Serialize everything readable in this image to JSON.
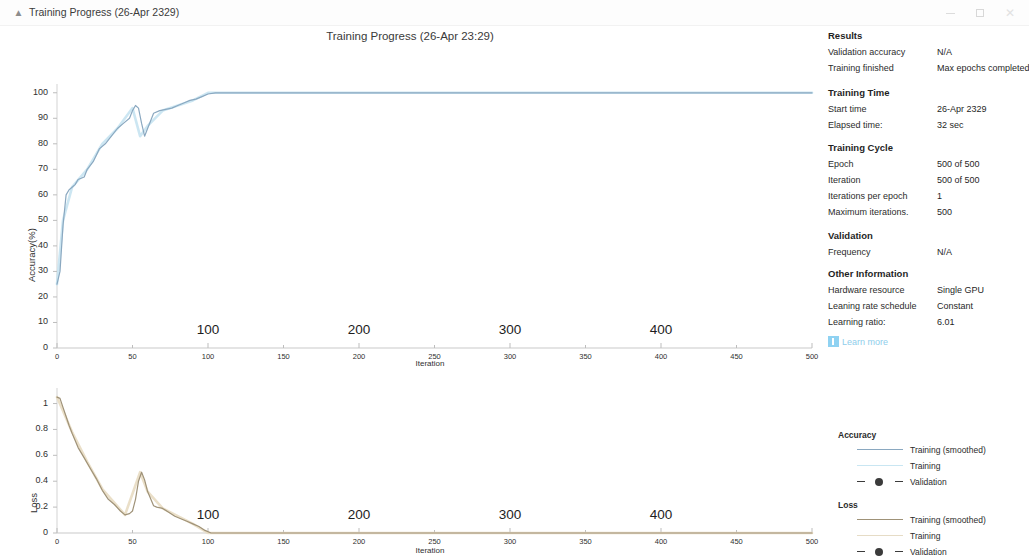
{
  "window": {
    "title": "Training Progress (26-Apr 2329)",
    "icon": "chart-icon",
    "minimize_label": "–",
    "maximize_label": "□",
    "close_label": "×"
  },
  "chart_title": "Training Progress (26-Apr 23:29)",
  "accuracy_chart": {
    "ylabel": "Accuracy(%)",
    "xlabel": "Iteration",
    "yticks": [
      "0",
      "10",
      "20",
      "30",
      "40",
      "50",
      "60",
      "70",
      "80",
      "90",
      "100"
    ],
    "xticks": [
      "0",
      "50",
      "100",
      "150",
      "200",
      "250",
      "300",
      "350",
      "400",
      "450",
      "500"
    ],
    "big_xlabels": [
      "100",
      "200",
      "300",
      "400"
    ]
  },
  "loss_chart": {
    "ylabel": "Loss",
    "xlabel": "Iteration",
    "yticks": [
      "0",
      "0.2",
      "0.4",
      "0.6",
      "0.8",
      "1"
    ],
    "xticks": [
      "0",
      "50",
      "100",
      "150",
      "200",
      "250",
      "300",
      "350",
      "400",
      "450",
      "500"
    ],
    "big_xlabels": [
      "100",
      "200",
      "300",
      "400"
    ]
  },
  "info": {
    "results": {
      "heading": "Results",
      "rows": [
        {
          "label": "Validation accuracy",
          "value": "N/A"
        },
        {
          "label": "Training finished",
          "value": "Max epochs completed"
        }
      ]
    },
    "training_time": {
      "heading": "Training Time",
      "rows": [
        {
          "label": "Start time",
          "value": "26-Apr 2329"
        },
        {
          "label": "Elapsed time:",
          "value": "32 sec"
        }
      ]
    },
    "training_cycle": {
      "heading": "Training Cycle",
      "rows": [
        {
          "label": "Epoch",
          "value": "500 of 500"
        },
        {
          "label": "Iteration",
          "value": "500 of 500"
        },
        {
          "label": "Iterations per epoch",
          "value": "1"
        },
        {
          "label": "Maximum iterations.",
          "value": "500"
        }
      ]
    },
    "validation": {
      "heading": "Validation",
      "rows": [
        {
          "label": "Frequency",
          "value": "N/A"
        }
      ]
    },
    "other_information": {
      "heading": "Other Information",
      "rows": [
        {
          "label": "Hardware resource",
          "value": "Single GPU"
        },
        {
          "label": "Leaning rate schedule",
          "value": "Constant"
        },
        {
          "label": "Learning ratio:",
          "value": "6.01"
        }
      ]
    },
    "learn_more": "Learn more"
  },
  "legend": {
    "accuracy": {
      "heading": "Accuracy",
      "items": [
        {
          "label": "Training (smoothed)",
          "color": "#8aa8c0",
          "style": "line"
        },
        {
          "label": "Training",
          "color": "#c9e6f2",
          "style": "line"
        },
        {
          "label": "Validation",
          "color": "#3b3b3b",
          "style": "dashed-marker"
        }
      ]
    },
    "loss": {
      "heading": "Loss",
      "items": [
        {
          "label": "Training (smoothed)",
          "color": "#9f9278",
          "style": "line"
        },
        {
          "label": "Training",
          "color": "#e6dcc6",
          "style": "line"
        },
        {
          "label": "Validation",
          "color": "#3b3b3b",
          "style": "dashed-marker"
        }
      ]
    }
  },
  "colors": {
    "accuracy_smoothed": "#8aa8c0",
    "accuracy_raw": "#c3e2f0",
    "loss_smoothed": "#9f9278",
    "loss_raw": "#e8dcc2",
    "axis": "#c9c9c9",
    "link": "#8ecdeb"
  },
  "chart_data": [
    {
      "type": "line",
      "title": "Training Progress (26-Apr 23:29)",
      "xlabel": "Iteration",
      "ylabel": "Accuracy(%)",
      "xlim": [
        0,
        500
      ],
      "ylim": [
        0,
        105
      ],
      "grid": false,
      "legend_position": "right",
      "series": [
        {
          "name": "Training (smoothed)",
          "color": "#8aa8c0",
          "x": [
            0,
            2,
            4,
            6,
            8,
            10,
            12,
            14,
            16,
            18,
            20,
            24,
            28,
            32,
            36,
            40,
            44,
            48,
            50,
            52,
            54,
            56,
            58,
            60,
            64,
            68,
            72,
            76,
            80,
            84,
            88,
            92,
            96,
            100,
            105,
            150,
            200,
            250,
            300,
            350,
            400,
            450,
            500
          ],
          "y": [
            25,
            30,
            48,
            60,
            62,
            63,
            64,
            66,
            66.5,
            67,
            70,
            73,
            78,
            80,
            83,
            86,
            88,
            90,
            93,
            95,
            94,
            88,
            83,
            86,
            92,
            93,
            93.5,
            94,
            95,
            96,
            97,
            97.5,
            98.5,
            99.5,
            100,
            100,
            100,
            100,
            100,
            100,
            100,
            100,
            100
          ]
        },
        {
          "name": "Training",
          "color": "#c3e2f0",
          "x": [
            0,
            4,
            10,
            20,
            30,
            40,
            50,
            55,
            60,
            70,
            80,
            90,
            100,
            200,
            300,
            400,
            500
          ],
          "y": [
            25,
            50,
            63,
            70,
            80,
            86,
            94,
            83,
            87,
            93,
            95,
            97,
            100,
            100,
            100,
            100,
            100
          ]
        }
      ]
    },
    {
      "type": "line",
      "xlabel": "Iteration",
      "ylabel": "Loss",
      "xlim": [
        0,
        500
      ],
      "ylim": [
        0,
        1.1
      ],
      "grid": false,
      "legend_position": "right",
      "series": [
        {
          "name": "Training (smoothed)",
          "color": "#9f9278",
          "x": [
            0,
            2,
            4,
            6,
            8,
            10,
            14,
            18,
            22,
            26,
            30,
            34,
            38,
            42,
            45,
            48,
            50,
            52,
            54,
            56,
            58,
            60,
            64,
            66,
            70,
            74,
            78,
            82,
            86,
            90,
            94,
            98,
            102,
            150,
            200,
            250,
            300,
            350,
            400,
            450,
            500
          ],
          "y": [
            1.05,
            1.04,
            0.97,
            0.9,
            0.83,
            0.77,
            0.66,
            0.58,
            0.5,
            0.42,
            0.33,
            0.26,
            0.22,
            0.17,
            0.14,
            0.15,
            0.17,
            0.26,
            0.4,
            0.47,
            0.41,
            0.32,
            0.21,
            0.2,
            0.19,
            0.16,
            0.13,
            0.11,
            0.09,
            0.07,
            0.05,
            0.02,
            0.0,
            0.0,
            0.0,
            0.0,
            0.0,
            0.0,
            0.0,
            0.0,
            0.0
          ]
        },
        {
          "name": "Training",
          "color": "#e8dcc2",
          "x": [
            0,
            10,
            20,
            30,
            45,
            55,
            60,
            70,
            80,
            90,
            100,
            200,
            300,
            400,
            500
          ],
          "y": [
            1.05,
            0.78,
            0.55,
            0.34,
            0.14,
            0.47,
            0.32,
            0.19,
            0.13,
            0.07,
            0.0,
            0.0,
            0.0,
            0.0,
            0.0
          ]
        }
      ]
    }
  ]
}
